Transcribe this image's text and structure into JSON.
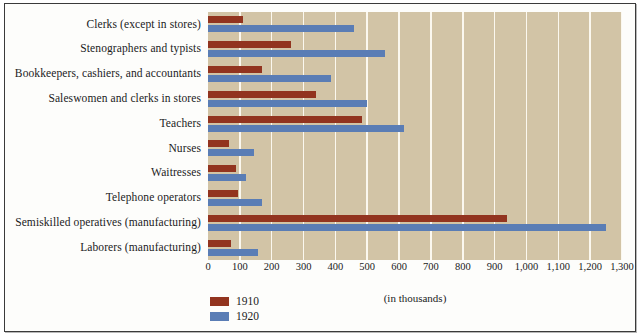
{
  "chart_data": {
    "type": "bar",
    "orientation": "horizontal",
    "title": "",
    "xlabel": "(in thousands)",
    "ylabel": "",
    "xlim": [
      0,
      1300
    ],
    "xticks": [
      0,
      100,
      200,
      300,
      400,
      500,
      600,
      700,
      800,
      900,
      1000,
      1100,
      1200,
      1300
    ],
    "xtick_labels": [
      "0",
      "100",
      "200",
      "300",
      "400",
      "500",
      "600",
      "700",
      "800",
      "900",
      "1,000",
      "1,100",
      "1,200",
      "1,300"
    ],
    "grid": "vertical",
    "legend_position": "bottom-left",
    "categories": [
      "Clerks (except in stores)",
      "Stenographers and typists",
      "Bookkeepers, cashiers, and accountants",
      "Saleswomen and clerks in stores",
      "Teachers",
      "Nurses",
      "Waitresses",
      "Telephone operators",
      "Semiskilled operatives (manufacturing)",
      "Laborers (manufacturing)"
    ],
    "series": [
      {
        "name": "1910",
        "color": "#92341f",
        "values": [
          110,
          260,
          170,
          340,
          485,
          65,
          88,
          95,
          940,
          72
        ]
      },
      {
        "name": "1920",
        "color": "#5a7db5",
        "values": [
          460,
          555,
          385,
          500,
          615,
          143,
          118,
          170,
          1250,
          158
        ]
      }
    ]
  },
  "legend": {
    "items": [
      {
        "label": "1910",
        "color": "#92341f"
      },
      {
        "label": "1920",
        "color": "#5a7db5"
      }
    ]
  },
  "axis": {
    "caption": "(in thousands)"
  }
}
